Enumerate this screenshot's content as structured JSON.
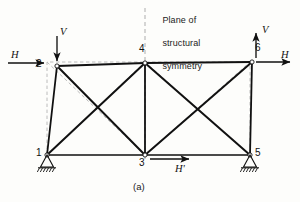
{
  "figure": {
    "caption": "(a)",
    "symmetry_note": "Plane of\nstructural\nsymmetry",
    "symmetry_note_lines": [
      "Plane of",
      "structural",
      "symmetry"
    ]
  },
  "colors": {
    "member": "#111111",
    "undeformed": "#b9b9b9",
    "symmetry_line": "#b9b9b9",
    "text": "#1a1a1a",
    "background": "#fdfdfb",
    "node_fill": "#ffffff"
  },
  "nodes": [
    {
      "id": "1",
      "label": "1",
      "x": 47,
      "y": 155,
      "label_x": 36,
      "label_y": 148,
      "support": "pin"
    },
    {
      "id": "2",
      "label": "2",
      "x": 57,
      "y": 66,
      "label_x": 36,
      "label_y": 59,
      "support": "none"
    },
    {
      "id": "3",
      "label": "3",
      "x": 145,
      "y": 155,
      "label_x": 139,
      "label_y": 158,
      "support": "none"
    },
    {
      "id": "4",
      "label": "4",
      "x": 145,
      "y": 63,
      "label_x": 139,
      "label_y": 44,
      "support": "none"
    },
    {
      "id": "5",
      "label": "5",
      "x": 250,
      "y": 155,
      "label_x": 255,
      "label_y": 148,
      "support": "pin"
    },
    {
      "id": "6",
      "label": "6",
      "x": 252,
      "y": 62,
      "label_x": 255,
      "label_y": 42,
      "support": "none"
    }
  ],
  "undeformed_outline": {
    "description": "original rectangular truss geometry",
    "corners": [
      [
        47,
        155
      ],
      [
        47,
        62
      ],
      [
        145,
        62
      ],
      [
        145,
        155
      ],
      [
        250,
        155
      ],
      [
        250,
        62
      ]
    ]
  },
  "loads": [
    {
      "name": "H-left",
      "label": "H",
      "direction": "right",
      "at_node": "2",
      "label_x": 11,
      "label_y": 50
    },
    {
      "name": "V-left",
      "label": "V",
      "direction": "down",
      "at_node": "2",
      "label_x": 58,
      "label_y": 28
    },
    {
      "name": "V-right",
      "label": "V",
      "direction": "up",
      "at_node": "6",
      "label_x": 262,
      "label_y": 25
    },
    {
      "name": "H-right",
      "label": "H",
      "direction": "right",
      "at_node": "6",
      "label_x": 281,
      "label_y": 50
    },
    {
      "name": "H-prime",
      "label": "H'",
      "direction": "right",
      "at_node": "3",
      "label_x": 176,
      "label_y": 165
    }
  ],
  "members": {
    "chords_top": [
      [
        "2",
        "4"
      ],
      [
        "4",
        "6"
      ]
    ],
    "chords_bottom": [
      [
        "1",
        "3"
      ],
      [
        "3",
        "5"
      ]
    ],
    "verticals": [
      [
        "1",
        "2"
      ],
      [
        "3",
        "4"
      ],
      [
        "5",
        "6"
      ]
    ],
    "diagonals": [
      [
        "1",
        "4"
      ],
      [
        "2",
        "3"
      ],
      [
        "3",
        "6"
      ],
      [
        "4",
        "5"
      ]
    ]
  },
  "supports": [
    {
      "at_node": "1",
      "type": "pin",
      "hatch_count": 6
    },
    {
      "at_node": "5",
      "type": "pin",
      "hatch_count": 6
    }
  ],
  "symmetry_axis": {
    "x": 145,
    "y_top": 8,
    "y_bottom": 160
  }
}
